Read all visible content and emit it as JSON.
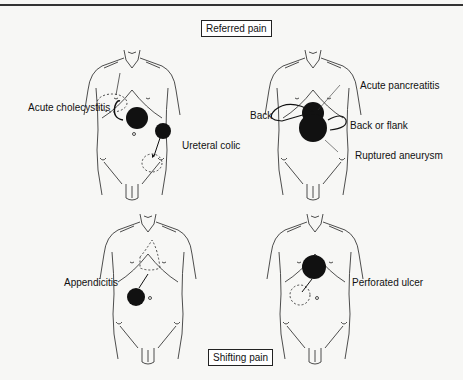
{
  "titles": {
    "top": "Referred pain",
    "bottom": "Shifting pain"
  },
  "panels": [
    {
      "id": "top-left",
      "labels": [
        "Acute cholecystitis",
        "Ureteral colic"
      ]
    },
    {
      "id": "top-right",
      "labels": [
        "Acute pancreatitis",
        "Back",
        "Back or flank",
        "Ruptured aneurysm"
      ]
    },
    {
      "id": "bottom-left",
      "labels": [
        "Appendicitis"
      ]
    },
    {
      "id": "bottom-right",
      "labels": [
        "Perforated ulcer"
      ]
    }
  ],
  "colors": {
    "background": "#f7f7f5",
    "ink": "#111111"
  }
}
